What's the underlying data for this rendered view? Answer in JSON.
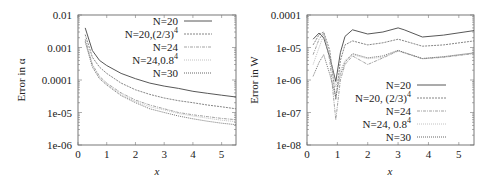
{
  "chart_data": [
    {
      "type": "line",
      "title": "",
      "xlabel": "x",
      "ylabel": "Error in α",
      "yscale": "log",
      "xlim": [
        0,
        5.5
      ],
      "ylim": [
        1e-06,
        0.01
      ],
      "xticks": [
        "0",
        "1",
        "2",
        "3",
        "4",
        "5"
      ],
      "yticks": [
        "1e-06",
        "1e-05",
        "0.0001",
        "0.001",
        "0.01"
      ],
      "legend_position": "upper right",
      "grid": false,
      "x": [
        0.25,
        0.5,
        0.75,
        1,
        1.5,
        2,
        2.5,
        3,
        3.5,
        4,
        4.5,
        5,
        5.5
      ],
      "series": [
        {
          "name": "N=20",
          "style": "solid",
          "values": [
            0.004,
            0.0008,
            0.0004,
            0.00028,
            0.00016,
            0.00011,
            8e-05,
            6.5e-05,
            5.5e-05,
            4.5e-05,
            3.9e-05,
            3.4e-05,
            3e-05
          ]
        },
        {
          "name": "N=20,(2/3)^4",
          "style": "dashed",
          "values": [
            0.0025,
            0.0005,
            0.00025,
            0.00016,
            8e-05,
            5e-05,
            3.6e-05,
            2.8e-05,
            2.3e-05,
            2e-05,
            1.7e-05,
            1.5e-05,
            1.3e-05
          ]
        },
        {
          "name": "N=24",
          "style": "dash-dot",
          "values": [
            0.0018,
            0.0003,
            0.00013,
            8e-05,
            4e-05,
            2.4e-05,
            1.7e-05,
            1.3e-05,
            1e-05,
            8.5e-06,
            7.5e-06,
            6.6e-06,
            6e-06
          ]
        },
        {
          "name": "N=24,0.8^4",
          "style": "dotted-light",
          "values": [
            0.0016,
            0.00028,
            0.00012,
            7.5e-05,
            3.6e-05,
            2.2e-05,
            1.5e-05,
            1.2e-05,
            9.3e-06,
            7.8e-06,
            6.7e-06,
            5.8e-06,
            5.2e-06
          ]
        },
        {
          "name": "N=30",
          "style": "dotted",
          "values": [
            0.0015,
            0.00025,
            0.00011,
            7e-05,
            3.3e-05,
            2e-05,
            1.3e-05,
            1e-05,
            7.8e-06,
            6.4e-06,
            5.4e-06,
            4.7e-06,
            4.2e-06
          ]
        }
      ]
    },
    {
      "type": "line",
      "title": "",
      "xlabel": "x",
      "ylabel": "Error in W",
      "yscale": "log",
      "xlim": [
        0,
        5.5
      ],
      "ylim": [
        1e-08,
        0.0001
      ],
      "xticks": [
        "0",
        "1",
        "2",
        "3",
        "4",
        "5"
      ],
      "yticks": [
        "1e-08",
        "1e-07",
        "1e-06",
        "1e-05",
        "0.0001"
      ],
      "legend_position": "lower right",
      "grid": false,
      "x": [
        0.2,
        0.4,
        0.55,
        0.75,
        0.95,
        1.1,
        1.25,
        1.5,
        2.0,
        2.5,
        3.0,
        3.2,
        3.8,
        4.5,
        5.5
      ],
      "series": [
        {
          "name": "N=20",
          "style": "solid",
          "values": [
            1.8e-05,
            2.8e-05,
            2e-05,
            5e-06,
            9e-07,
            7e-06,
            2.2e-05,
            3.5e-05,
            2.6e-05,
            3e-05,
            4e-05,
            3.5e-05,
            2.1e-05,
            2.4e-05,
            3.3e-05
          ]
        },
        {
          "name": "N=20, (2/3)^4",
          "style": "dashed",
          "values": [
            1.2e-05,
            2.5e-05,
            3e-05,
            8e-06,
            2.5e-07,
            4e-06,
            1.2e-05,
            1.6e-05,
            1.2e-05,
            1.4e-05,
            1.8e-05,
            1.6e-05,
            1.1e-05,
            1.2e-05,
            1.6e-05
          ]
        },
        {
          "name": "N=24",
          "style": "dash-dot",
          "values": [
            6e-06,
            1.8e-05,
            2.8e-05,
            4e-06,
            6e-08,
            1e-06,
            3e-06,
            5.5e-06,
            3e-06,
            4.8e-06,
            7.8e-06,
            6.8e-06,
            4.5e-06,
            5e-06,
            6.5e-06
          ]
        },
        {
          "name": "N=24, 0.8^4",
          "style": "dotted-light",
          "values": [
            3e-06,
            1e-05,
            2.5e-05,
            6e-06,
            6e-07,
            2e-06,
            4e-06,
            6e-06,
            4.5e-06,
            5e-06,
            8e-06,
            7e-06,
            4.6e-06,
            5.2e-06,
            6.8e-06
          ]
        },
        {
          "name": "N=30",
          "style": "dotted",
          "values": [
            1.3e-06,
            3.5e-06,
            6e-06,
            1.5e-06,
            3e-07,
            1.5e-06,
            3.5e-06,
            6.5e-06,
            4.8e-06,
            5.5e-06,
            8.2e-06,
            7e-06,
            4.6e-06,
            5.2e-06,
            6.8e-06
          ]
        }
      ]
    }
  ],
  "plots": [
    {
      "ylabel": "Error in α",
      "xlabel": "x",
      "yticks": [
        "0.01",
        "0.001",
        "0.0001",
        "1e-05",
        "1e-06"
      ],
      "xticks": [
        "0",
        "1",
        "2",
        "3",
        "4",
        "5"
      ],
      "legend": [
        "N=20",
        "N=20,(2/3)",
        "N=24",
        "N=24,0.8",
        "N=30"
      ],
      "legend_sup": [
        "",
        "4",
        "",
        "4",
        ""
      ]
    },
    {
      "ylabel": "Error in W",
      "xlabel": "x",
      "yticks": [
        "0.0001",
        "1e-05",
        "1e-06",
        "1e-07",
        "1e-08"
      ],
      "xticks": [
        "0",
        "1",
        "2",
        "3",
        "4",
        "5"
      ],
      "legend": [
        "N=20",
        "N=20, (2/3)",
        "N=24",
        "N=24, 0.8",
        "N=30"
      ],
      "legend_sup": [
        "",
        "4",
        "",
        "4",
        ""
      ]
    }
  ]
}
